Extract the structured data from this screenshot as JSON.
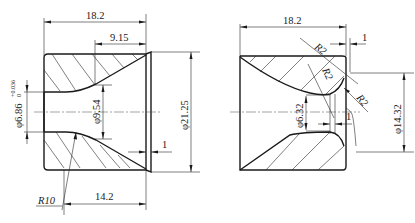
{
  "figure": {
    "type": "engineering-section-drawing",
    "background": "#ffffff",
    "line_color": "#1a1a1a"
  },
  "left_view": {
    "name": "die-section-left",
    "dimensions": {
      "overall_length": "18.2",
      "cone_length": "9.15",
      "bore_diameter": "φ6.86",
      "bore_tolerance_upper": "+0.036",
      "bore_tolerance_lower": "0",
      "throat_diameter": "φ9.54",
      "outer_diameter": "φ21.25",
      "land_offset": "1",
      "radius": "R10",
      "land_length": "14.2"
    }
  },
  "right_view": {
    "name": "die-section-right",
    "dimensions": {
      "overall_length": "18.2",
      "radius_top": "R2",
      "radius_mid": "R2",
      "radius_right": "R2",
      "top_offset": "1",
      "bore_diameter": "φ6.32",
      "land_offset": "1",
      "outer_diameter": "φ14.32"
    }
  }
}
